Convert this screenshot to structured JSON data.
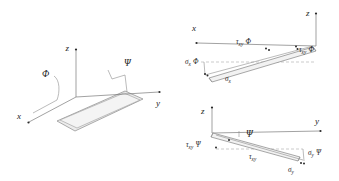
{
  "figure": {
    "background_color": "#ffffff",
    "line_color": "#6e6e6e",
    "text_color": "#1c1c1c",
    "plate_fill": "#ededed"
  },
  "panels": [
    {
      "id": "panel-plate-axes",
      "name": "plate-with-axes-diagram",
      "description": "Inclined rectangular plate shown with 3D x-y-z axes and rotation angles",
      "axes": [
        {
          "name": "x-axis",
          "label": "x"
        },
        {
          "name": "y-axis",
          "label": "y"
        },
        {
          "name": "z-axis",
          "label": "z"
        }
      ],
      "angles": [
        {
          "name": "phi-angle",
          "label": "Φ"
        },
        {
          "name": "psi-angle",
          "label": "Ψ"
        }
      ]
    },
    {
      "id": "panel-x-section",
      "name": "x-direction-stress-diagram",
      "description": "Edge-on view of plate strip in the x-z plane with shear and normal stress labels",
      "axes": [
        {
          "name": "x-axis",
          "label": "x"
        },
        {
          "name": "z-axis",
          "label": "z"
        }
      ],
      "labels": [
        {
          "name": "tau-xy-phi-left",
          "tau": "τ",
          "sub": "xy",
          "factor": "Φ"
        },
        {
          "name": "tau-xy-phi-right",
          "tau": "τ",
          "sub": "xy",
          "factor": "Φ"
        },
        {
          "name": "sigma-x-phi",
          "sigma": "σ",
          "sub": "x",
          "factor": "Φ"
        },
        {
          "name": "sigma-x",
          "sigma": "σ",
          "sub": "x",
          "factor": ""
        }
      ]
    },
    {
      "id": "panel-y-section",
      "name": "y-direction-stress-diagram",
      "description": "Edge-on view of plate strip in the y-z plane with shear and normal stress labels",
      "axes": [
        {
          "name": "y-axis",
          "label": "y"
        },
        {
          "name": "z-axis",
          "label": "z"
        }
      ],
      "angles": [
        {
          "name": "psi-angle",
          "label": "Ψ"
        }
      ],
      "labels": [
        {
          "name": "tau-xy-psi",
          "tau": "τ",
          "sub": "xy",
          "factor": "Ψ"
        },
        {
          "name": "tau-xy",
          "tau": "τ",
          "sub": "xy",
          "factor": ""
        },
        {
          "name": "sigma-y-psi",
          "sigma": "σ",
          "sub": "y",
          "factor": "Ψ"
        },
        {
          "name": "sigma-y",
          "sigma": "σ",
          "sub": "y",
          "factor": ""
        }
      ]
    }
  ],
  "text": {
    "x": "x",
    "y": "y",
    "z": "z",
    "phi": "Φ",
    "psi": "Ψ",
    "tau": "τ",
    "sigma": "σ",
    "sub_xy": "xy",
    "sub_x": "x",
    "sub_y": "y"
  }
}
